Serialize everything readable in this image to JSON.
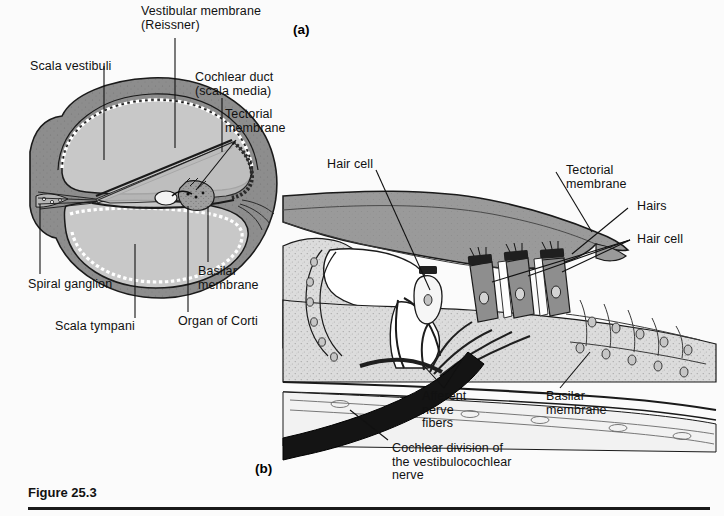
{
  "figure": {
    "caption": "Figure 25.3",
    "panel_a_tag": "(a)",
    "panel_b_tag": "(b)"
  },
  "colors": {
    "background": "#fbfbfb",
    "bone_dark": "#8a8a8a",
    "fluid_light": "#c8c8c8",
    "tectorial_gray": "#9a9a9a",
    "tissue_light": "#d9d9d9",
    "hair_cell_gray": "#8e8e8e",
    "nerve_black": "#141414",
    "outline": "#1a1a1a",
    "text": "#111111"
  },
  "panel_a": {
    "labels": [
      {
        "id": "scala-vestibuli",
        "text": "Scala vestibuli"
      },
      {
        "id": "vestibular-membrane",
        "text": "Vestibular membrane\n(Reissner)"
      },
      {
        "id": "cochlear-duct",
        "text": "Cochlear duct\n(scala media)"
      },
      {
        "id": "tectorial-membrane",
        "text": "Tectorial\nmembrane"
      },
      {
        "id": "spiral-ganglion",
        "text": "Spiral ganglion"
      },
      {
        "id": "scala-tympani",
        "text": "Scala tympani"
      },
      {
        "id": "basilar-membrane",
        "text": "Basilar\nmembrane"
      },
      {
        "id": "organ-of-corti",
        "text": "Organ of Corti"
      }
    ]
  },
  "panel_b": {
    "labels": [
      {
        "id": "hair-cell-left",
        "text": "Hair cell"
      },
      {
        "id": "tectorial-membrane",
        "text": "Tectorial\nmembrane"
      },
      {
        "id": "hairs",
        "text": "Hairs"
      },
      {
        "id": "hair-cell-right",
        "text": "Hair cell"
      },
      {
        "id": "afferent-nerve",
        "text": "Afferent\nnerve\nfibers"
      },
      {
        "id": "basilar-membrane",
        "text": "Basilar\nmembrane"
      },
      {
        "id": "cochlear-division",
        "text": "Cochlear division of\nthe vestibulocochlear\nnerve"
      }
    ]
  }
}
